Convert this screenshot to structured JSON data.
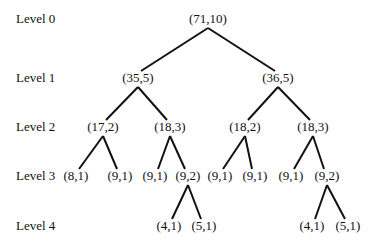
{
  "diagram": {
    "type": "binary-tree",
    "levels": [
      {
        "label": "Level 0",
        "y": 11
      },
      {
        "label": "Level 1",
        "y": 70
      },
      {
        "label": "Level 2",
        "y": 119
      },
      {
        "label": "Level 3",
        "y": 168
      },
      {
        "label": "Level 4",
        "y": 218
      }
    ],
    "nodes": [
      {
        "id": "n0",
        "label": "(71,10)",
        "level": 0,
        "x": 208
      },
      {
        "id": "n1",
        "label": "(35,5)",
        "level": 1,
        "x": 138
      },
      {
        "id": "n2",
        "label": "(36,5)",
        "level": 1,
        "x": 278
      },
      {
        "id": "n3",
        "label": "(17,2)",
        "level": 2,
        "x": 103
      },
      {
        "id": "n4",
        "label": "(18,3)",
        "level": 2,
        "x": 170
      },
      {
        "id": "n5",
        "label": "(18,2)",
        "level": 2,
        "x": 245
      },
      {
        "id": "n6",
        "label": "(18,3)",
        "level": 2,
        "x": 313
      },
      {
        "id": "n7",
        "label": "(8,1)",
        "level": 3,
        "x": 76
      },
      {
        "id": "n8",
        "label": "(9,1)",
        "level": 3,
        "x": 120
      },
      {
        "id": "n9",
        "label": "(9,1)",
        "level": 3,
        "x": 155
      },
      {
        "id": "n10",
        "label": "(9,2)",
        "level": 3,
        "x": 188
      },
      {
        "id": "n11",
        "label": "(9,1)",
        "level": 3,
        "x": 220
      },
      {
        "id": "n12",
        "label": "(9,1)",
        "level": 3,
        "x": 255
      },
      {
        "id": "n13",
        "label": "(9,1)",
        "level": 3,
        "x": 291
      },
      {
        "id": "n14",
        "label": "(9,2)",
        "level": 3,
        "x": 327
      },
      {
        "id": "n15",
        "label": "(4,1)",
        "level": 4,
        "x": 169
      },
      {
        "id": "n16",
        "label": "(5,1)",
        "level": 4,
        "x": 204
      },
      {
        "id": "n17",
        "label": "(4,1)",
        "level": 4,
        "x": 312
      },
      {
        "id": "n18",
        "label": "(5,1)",
        "level": 4,
        "x": 348
      }
    ],
    "edges": [
      [
        "n0",
        "n1"
      ],
      [
        "n0",
        "n2"
      ],
      [
        "n1",
        "n3"
      ],
      [
        "n1",
        "n4"
      ],
      [
        "n2",
        "n5"
      ],
      [
        "n2",
        "n6"
      ],
      [
        "n3",
        "n7"
      ],
      [
        "n3",
        "n8"
      ],
      [
        "n4",
        "n9"
      ],
      [
        "n4",
        "n10"
      ],
      [
        "n5",
        "n11"
      ],
      [
        "n5",
        "n12"
      ],
      [
        "n6",
        "n13"
      ],
      [
        "n6",
        "n14"
      ],
      [
        "n10",
        "n15"
      ],
      [
        "n10",
        "n16"
      ],
      [
        "n14",
        "n17"
      ],
      [
        "n14",
        "n18"
      ]
    ],
    "line_color": "#111111"
  }
}
